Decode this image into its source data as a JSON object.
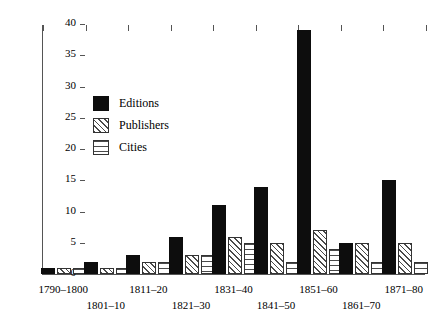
{
  "chart_data": {
    "type": "bar",
    "title": "",
    "subtitle": "",
    "xlabel": "",
    "ylabel": "",
    "categories": [
      "1790–1800",
      "1801–10",
      "1811–20",
      "1821–30",
      "1831–40",
      "1841–50",
      "1851–60",
      "1861–70",
      "1871–80"
    ],
    "series": [
      {
        "name": "Editions",
        "values": [
          1,
          2,
          3,
          6,
          11,
          14,
          39,
          5,
          15
        ]
      },
      {
        "name": "Publishers",
        "values": [
          1,
          1,
          2,
          3,
          6,
          5,
          7,
          5,
          5
        ]
      },
      {
        "name": "Cities",
        "values": [
          1,
          1,
          2,
          3,
          5,
          2,
          4,
          2,
          2
        ]
      }
    ],
    "ylim": [
      0,
      40
    ],
    "yticks": [
      0,
      5,
      10,
      15,
      20,
      25,
      30,
      35,
      40
    ],
    "ytick_labels": [
      "0",
      "5",
      "10",
      "15",
      "20",
      "25",
      "30",
      "35",
      "40"
    ],
    "grid": false,
    "legend_position": "upper-left-inside",
    "legend_entries": [
      {
        "label": "Editions",
        "pattern": "solid-black"
      },
      {
        "label": "Publishers",
        "pattern": "diagonal-hatch"
      },
      {
        "label": "Cities",
        "pattern": "horizontal-lines"
      }
    ],
    "xtick_label_rows": [
      0,
      1,
      0,
      1,
      0,
      1,
      0,
      1,
      0
    ],
    "colors": {
      "editions": "#0d0d0d",
      "publishers_hatch": "#4a4a4a",
      "cities_hatch": "#4a4a4a",
      "axis": "#555555",
      "background": "#ffffff",
      "text": "#000000"
    }
  }
}
